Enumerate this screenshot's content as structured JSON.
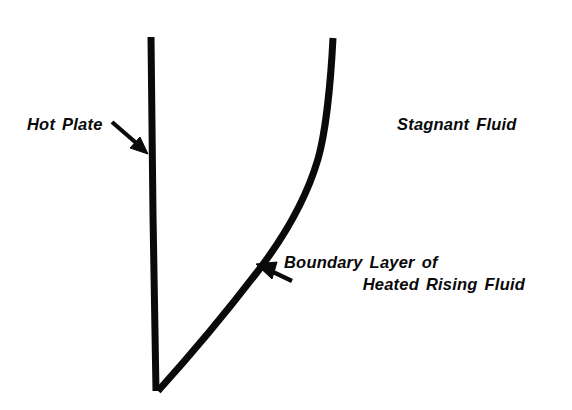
{
  "figure": {
    "type": "technical-diagram",
    "background_color": "#ffffff",
    "ink_color": "#0a0a0a",
    "canvas": {
      "width": 572,
      "height": 410
    }
  },
  "labels": {
    "hot_plate": {
      "words": [
        "Hot",
        "Plate"
      ],
      "text": "Hot Plate",
      "word1": "Hot",
      "word2": "Plate"
    },
    "stagnant_fluid": {
      "words": [
        "Stagnant",
        "Fluid"
      ],
      "text": "Stagnant Fluid",
      "word1": "Stagnant",
      "word2": "Fluid"
    },
    "boundary_layer": {
      "text": "Boundary Layer of Heated Rising Fluid",
      "line1": {
        "word1": "Boundary",
        "word2": "Layer",
        "word3": "of"
      },
      "line2": {
        "word1": "Heated",
        "word2": "Rising",
        "word3": "Fluid"
      }
    }
  },
  "shapes": {
    "hot_plate_line": {
      "name": "hot-plate",
      "stroke_width": 7,
      "points": [
        [
          151,
          37
        ],
        [
          153,
          215
        ],
        [
          156,
          391
        ]
      ]
    },
    "boundary_layer_curve": {
      "name": "boundary-layer-curve",
      "stroke_width": 7,
      "points": [
        [
          333,
          38
        ],
        [
          326,
          112
        ],
        [
          306,
          190
        ],
        [
          276,
          245
        ],
        [
          252,
          281
        ],
        [
          206,
          340
        ],
        [
          158,
          391
        ]
      ]
    },
    "arrow_hot_plate": {
      "name": "hot-plate-pointer",
      "from": [
        113,
        123
      ],
      "to": [
        147,
        152
      ],
      "direction": "down-right"
    },
    "arrow_boundary_layer": {
      "name": "boundary-layer-pointer",
      "from": [
        292,
        281
      ],
      "to": [
        258,
        266
      ],
      "direction": "up-left"
    }
  },
  "colors": {
    "ink": "#0a0a0a",
    "paper": "#ffffff"
  }
}
